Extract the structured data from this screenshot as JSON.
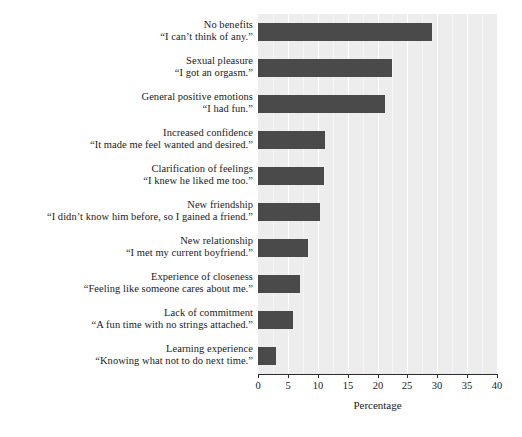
{
  "chart_data": {
    "type": "bar",
    "orientation": "horizontal",
    "title": "",
    "subtitle": "",
    "xlabel": "Percentage",
    "ylabel": "",
    "xlim": [
      0,
      40
    ],
    "xticks": [
      0,
      5,
      10,
      15,
      20,
      25,
      30,
      35,
      40
    ],
    "grid": true,
    "legend": false,
    "bar_color": "#4a4a4a",
    "plot_background": "#ededed",
    "gridline_color": "#ffffff",
    "categories": [
      "No benefits",
      "Sexual pleasure",
      "General positive emotions",
      "Increased confidence",
      "Clarification of feelings",
      "New friendship",
      "New relationship",
      "Experience of closeness",
      "Lack of commitment",
      "Learning experience"
    ],
    "quotes": [
      "“I can’t think of any.”",
      "“I got an orgasm.”",
      "“I had fun.”",
      "“It made me feel wanted and desired.”",
      "“I knew he liked me too.”",
      "“I didn’t know him before, so I gained a friend.”",
      "“I met my current boyfriend.”",
      "“Feeling like someone cares about me.”",
      "“A fun time with no strings attached.”",
      "“Knowing what not to do next time.”"
    ],
    "values": [
      29.2,
      22.4,
      21.2,
      11.2,
      11.1,
      10.4,
      8.3,
      7.0,
      5.8,
      3.0
    ]
  },
  "axis": {
    "x_title": "Percentage",
    "tick_labels": [
      "0",
      "5",
      "10",
      "15",
      "20",
      "25",
      "30",
      "35",
      "40"
    ]
  }
}
